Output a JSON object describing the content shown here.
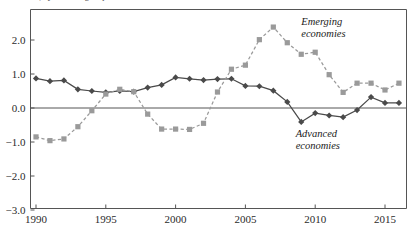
{
  "chart_data": {
    "type": "line",
    "title": "",
    "xlabel": "",
    "ylabel": "",
    "xlim": [
      1989.4,
      2016.6
    ],
    "ylim": [
      -3.0,
      2.8
    ],
    "grid": false,
    "legend_position": "inline-annotation",
    "x_ticks": [
      "1990",
      "1995",
      "2000",
      "2005",
      "2010",
      "2015"
    ],
    "x_tick_values": [
      1990,
      1995,
      2000,
      2005,
      2010,
      2015
    ],
    "y_ticks": [
      "2.0",
      "1.0",
      "0.0",
      "-1.0",
      "-2.0",
      "-3.0"
    ],
    "y_tick_values": [
      2.0,
      1.0,
      0.0,
      -1.0,
      -2.0,
      -3.0
    ],
    "zero_line": 0.0,
    "x": [
      1990,
      1991,
      1992,
      1993,
      1994,
      1995,
      1996,
      1997,
      1998,
      1999,
      2000,
      2001,
      2002,
      2003,
      2004,
      2005,
      2006,
      2007,
      2008,
      2009,
      2010,
      2011,
      2012,
      2013,
      2014,
      2015,
      2016
    ],
    "series": [
      {
        "name": "Advanced economies",
        "marker": "diamond",
        "line_style": "solid",
        "color": "#4a4a4a",
        "values": [
          0.87,
          0.79,
          0.81,
          0.55,
          0.5,
          0.46,
          0.5,
          0.48,
          0.6,
          0.68,
          0.9,
          0.86,
          0.82,
          0.85,
          0.86,
          0.65,
          0.64,
          0.51,
          0.18,
          -0.41,
          -0.15,
          -0.22,
          -0.27,
          -0.06,
          0.32,
          0.15,
          0.15
        ]
      },
      {
        "name": "Emerging economies",
        "marker": "square",
        "line_style": "dashed",
        "color": "#9a9a9a",
        "values": [
          -0.85,
          -0.96,
          -0.91,
          -0.55,
          -0.08,
          0.41,
          0.55,
          0.48,
          -0.18,
          -0.62,
          -0.62,
          -0.63,
          -0.45,
          0.47,
          1.14,
          1.26,
          2.01,
          2.38,
          1.92,
          1.58,
          1.64,
          0.98,
          0.46,
          0.73,
          0.73,
          0.53,
          0.73
        ]
      }
    ],
    "annotations": [
      {
        "text_line1": "Emerging",
        "text_line2": "economies",
        "x": 2009.0,
        "y": 2.45
      },
      {
        "text_line1": "Advanced",
        "text_line2": "economies",
        "x": 2008.6,
        "y": -0.85
      }
    ]
  },
  "partial_title": {
    "text": "countries, by income group"
  },
  "colors": {
    "advanced": "#4a4a4a",
    "emerging": "#9a9a9a",
    "axis": "#555555",
    "zero_line": "#555555",
    "background": "#ffffff"
  }
}
